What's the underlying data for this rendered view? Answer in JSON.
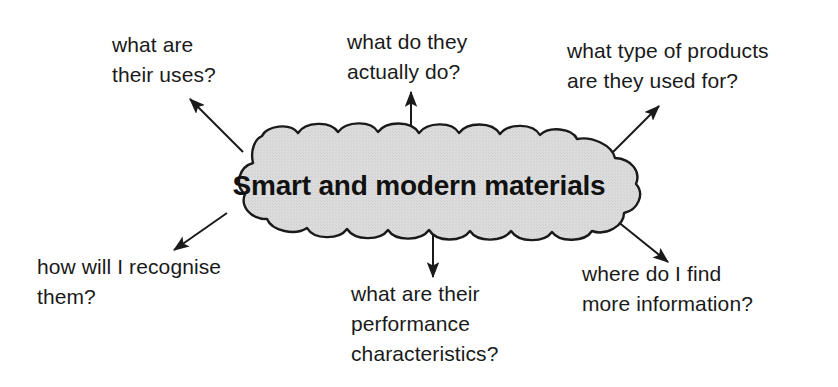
{
  "diagram": {
    "type": "mind-map",
    "central_node": {
      "label": "Smart and modern materials",
      "shape": "cloud",
      "fill_color": "#d9d9d9",
      "stroke_color": "#1a1a1a"
    },
    "branches": [
      {
        "id": "uses",
        "label": "what are\nthEIR uses?",
        "text": "what are\ntheir uses?",
        "position": "top-left",
        "arrow_direction": "up-left"
      },
      {
        "id": "actually-do",
        "text": "what do they\nactually do?",
        "position": "top-center",
        "arrow_direction": "up"
      },
      {
        "id": "products",
        "text": "what type of products\nare they used for?",
        "position": "top-right",
        "arrow_direction": "up-right"
      },
      {
        "id": "recognise",
        "text": "how will I recognise\nthem?",
        "position": "bottom-left",
        "arrow_direction": "down-left"
      },
      {
        "id": "performance",
        "text": "what are their\nperformance\ncharacteristics?",
        "position": "bottom-center",
        "arrow_direction": "down"
      },
      {
        "id": "information",
        "text": "where do I find\nmore information?",
        "position": "bottom-right",
        "arrow_direction": "down-right"
      }
    ]
  }
}
